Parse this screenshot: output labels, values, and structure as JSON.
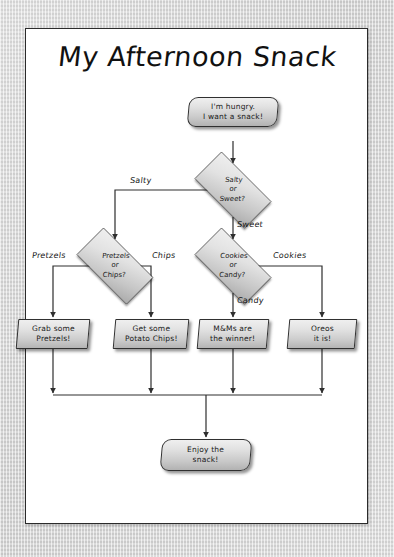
{
  "document": {
    "title": "My Afternoon Snack"
  },
  "flowchart": {
    "type": "flowchart",
    "orientation": "top-down",
    "nodes": [
      {
        "id": "start",
        "shape": "terminal",
        "text": "I'm hungry.\nI want a snack!"
      },
      {
        "id": "d_salty",
        "shape": "decision",
        "text": "Salty\nor\nSweet?"
      },
      {
        "id": "d_pretzels",
        "shape": "decision",
        "text": "Pretzels\nor\nChips?"
      },
      {
        "id": "d_cookies",
        "shape": "decision",
        "text": "Cookies\nor\nCandy?"
      },
      {
        "id": "r_pretzels",
        "shape": "process",
        "text": "Grab some\nPretzels!"
      },
      {
        "id": "r_chips",
        "shape": "process",
        "text": "Get some\nPotato Chips!"
      },
      {
        "id": "r_mms",
        "shape": "process",
        "text": "M&Ms are\nthe winner!"
      },
      {
        "id": "r_oreos",
        "shape": "process",
        "text": "Oreos\nit is!"
      },
      {
        "id": "end",
        "shape": "terminal",
        "text": "Enjoy the\nsnack!"
      }
    ],
    "edge_labels": {
      "salty": "Salty",
      "sweet": "Sweet",
      "pretzels": "Pretzels",
      "chips": "Chips",
      "cookies": "Cookies",
      "candy": "Candy"
    },
    "edges": [
      {
        "from": "start",
        "to": "d_salty",
        "label": ""
      },
      {
        "from": "d_salty",
        "to": "d_pretzels",
        "label": "Salty"
      },
      {
        "from": "d_salty",
        "to": "d_cookies",
        "label": "Sweet"
      },
      {
        "from": "d_pretzels",
        "to": "r_pretzels",
        "label": "Pretzels"
      },
      {
        "from": "d_pretzels",
        "to": "r_chips",
        "label": "Chips"
      },
      {
        "from": "d_cookies",
        "to": "r_oreos",
        "label": "Cookies"
      },
      {
        "from": "d_cookies",
        "to": "r_mms",
        "label": "Candy"
      },
      {
        "from": "r_pretzels",
        "to": "end",
        "label": ""
      },
      {
        "from": "r_chips",
        "to": "end",
        "label": ""
      },
      {
        "from": "r_mms",
        "to": "end",
        "label": ""
      },
      {
        "from": "r_oreos",
        "to": "end",
        "label": ""
      }
    ]
  },
  "colors": {
    "page": "#ffffff",
    "border": "#2b2b2b",
    "ink": "#1a1a1a",
    "shape_fill_top": "#efefef",
    "shape_fill_bottom": "#b2b2b2",
    "backdrop": "#d8d8d8"
  }
}
